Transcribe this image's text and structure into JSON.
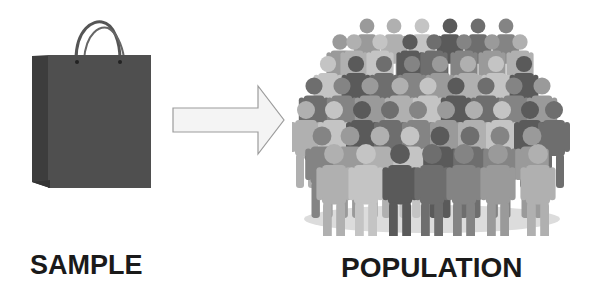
{
  "diagram": {
    "left": {
      "icon": "shopping-bag-icon",
      "label": "SAMPLE"
    },
    "connector": {
      "icon": "right-arrow-icon"
    },
    "right": {
      "icon": "crowd-of-people-icon",
      "label": "POPULATION"
    }
  },
  "colors": {
    "background": "#ffffff",
    "bag_front": "#4e4e4e",
    "bag_side": "#3d3d3d",
    "arrow_fill": "#f2f2f2",
    "arrow_stroke": "#9a9a9a",
    "text": "#1a1a1a",
    "people_shades": [
      "#5a5a5a",
      "#6e6e6e",
      "#848484",
      "#9a9a9a",
      "#b0b0b0",
      "#c4c4c4"
    ]
  }
}
